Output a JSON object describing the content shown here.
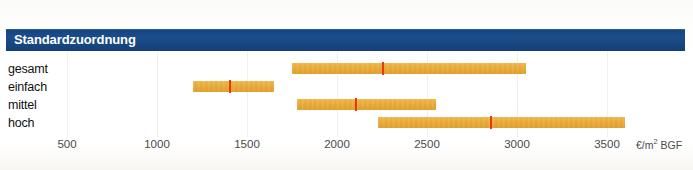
{
  "header": {
    "title": "Standardzuordnung",
    "background_color": "#164781",
    "text_color": "#ffffff"
  },
  "colors": {
    "bar": "#e9ab3a",
    "marker": "#e8380d",
    "gridline": "#f0f0ee",
    "axis_text": "#4a4a4a"
  },
  "axis": {
    "unit_prefix": "€/m",
    "unit_sup": "2",
    "unit_suffix": " BGF",
    "unit_label": "€/m² BGF",
    "ticks": [
      {
        "label": "500",
        "value": 500
      },
      {
        "label": "1000",
        "value": 1000
      },
      {
        "label": "1500",
        "value": 1500
      },
      {
        "label": "2000",
        "value": 2000
      },
      {
        "label": "2500",
        "value": 2500
      },
      {
        "label": "3000",
        "value": 3000
      },
      {
        "label": "3500",
        "value": 3500
      }
    ]
  },
  "chart_data": {
    "type": "bar",
    "title": "Standardzuordnung",
    "xlabel": "€/m² BGF",
    "ylabel": "",
    "xlim": [
      0,
      3800
    ],
    "grid": true,
    "legend": "none",
    "orientation": "horizontal",
    "note": "Floating range bars with a red median marker per category",
    "categories": [
      "gesamt",
      "einfach",
      "mittel",
      "hoch"
    ],
    "series": [
      {
        "name": "Spannweite",
        "ranges": [
          {
            "category": "gesamt",
            "low": 1750,
            "high": 3050,
            "marker": 2250
          },
          {
            "category": "einfach",
            "low": 1200,
            "high": 1650,
            "marker": 1400
          },
          {
            "category": "mittel",
            "low": 1780,
            "high": 2550,
            "marker": 2100
          },
          {
            "category": "hoch",
            "low": 2230,
            "high": 3600,
            "marker": 2850
          }
        ]
      }
    ]
  },
  "rows": [
    {
      "label": "gesamt",
      "low": 1750,
      "high": 3050,
      "marker": 2250
    },
    {
      "label": "einfach",
      "low": 1200,
      "high": 1650,
      "marker": 1400
    },
    {
      "label": "mittel",
      "low": 1780,
      "high": 2550,
      "marker": 2100
    },
    {
      "label": "hoch",
      "low": 2230,
      "high": 3600,
      "marker": 2850
    }
  ]
}
